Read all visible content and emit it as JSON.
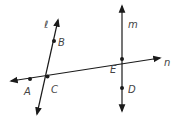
{
  "diagram": {
    "lines": [
      {
        "name": "l",
        "label": "ℓ"
      },
      {
        "name": "m",
        "label": "m"
      },
      {
        "name": "n",
        "label": "n"
      }
    ],
    "points": {
      "A": "A",
      "B": "B",
      "C": "C",
      "D": "D",
      "E": "E"
    },
    "colors": {
      "stroke": "#1a1a1a",
      "label": "#444444"
    }
  }
}
